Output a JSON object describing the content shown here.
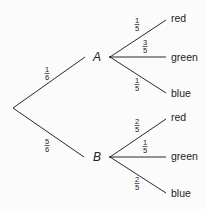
{
  "diagram": {
    "type": "probability-tree",
    "root": {
      "branches": [
        {
          "node": "A",
          "probability": {
            "num": "1",
            "den": "6"
          },
          "children": [
            {
              "label": "red",
              "probability": {
                "num": "1",
                "den": "5"
              }
            },
            {
              "label": "green",
              "probability": {
                "num": "3",
                "den": "5"
              }
            },
            {
              "label": "blue",
              "probability": {
                "num": "1",
                "den": "5"
              }
            }
          ]
        },
        {
          "node": "B",
          "probability": {
            "num": "5",
            "den": "6"
          },
          "children": [
            {
              "label": "red",
              "probability": {
                "num": "2",
                "den": "5"
              }
            },
            {
              "label": "green",
              "probability": {
                "num": "1",
                "den": "5"
              }
            },
            {
              "label": "blue",
              "probability": {
                "num": "2",
                "den": "5"
              }
            }
          ]
        }
      ]
    }
  }
}
